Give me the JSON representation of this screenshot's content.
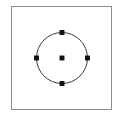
{
  "app": {
    "title": "Shape Canvas",
    "canvas_label": "Drawing canvas"
  },
  "canvas": {
    "background_color": "#ffffff",
    "border_color": "#8c8c8c",
    "border_width": 1,
    "frame": {
      "x": 11,
      "y": 6,
      "width": 101,
      "height": 104
    }
  },
  "shape": {
    "type": "circle",
    "name": "Circle",
    "stroke_color": "#3a3a3a",
    "stroke_width": 1,
    "fill": "none",
    "center_x": 51,
    "center_y": 52,
    "radius": 26
  },
  "selection": {
    "state": "selected",
    "handle_color": "#111111",
    "handle_size": 5,
    "handles": [
      {
        "id": "handle-north",
        "label": "Top handle",
        "x": 51,
        "y": 26
      },
      {
        "id": "handle-east",
        "label": "Right handle",
        "x": 77,
        "y": 52
      },
      {
        "id": "handle-south",
        "label": "Bottom handle",
        "x": 51,
        "y": 78
      },
      {
        "id": "handle-west",
        "label": "Left handle",
        "x": 25,
        "y": 52
      },
      {
        "id": "handle-center",
        "label": "Center anchor",
        "x": 51,
        "y": 52
      }
    ]
  }
}
